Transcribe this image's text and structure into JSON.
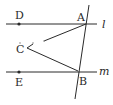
{
  "diagram": {
    "type": "geometry",
    "lines": {
      "l": {
        "label": "l"
      },
      "m": {
        "label": "m"
      }
    },
    "points": {
      "A": {
        "label": "A"
      },
      "B": {
        "label": "B"
      },
      "C": {
        "label": "C"
      },
      "D": {
        "label": "D"
      },
      "E": {
        "label": "E"
      }
    },
    "colors": {
      "stroke": "#2a2a2a",
      "background": "#ffffff"
    }
  }
}
